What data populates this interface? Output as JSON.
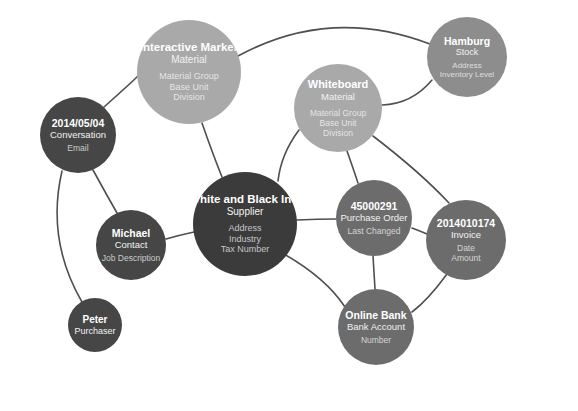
{
  "diagram": {
    "background_color": "#ffffff",
    "edge_color": "#4f4f4f"
  },
  "nodes": [
    {
      "id": "interactive-marker",
      "title": "Interactive Marker",
      "type": "Material",
      "attributes": [
        "Material Group",
        "Base Unit",
        "Division"
      ],
      "color": "#a9a9a9",
      "cx": 189,
      "cy": 72,
      "r": 52,
      "title_size": 11.5,
      "type_size": 10,
      "attr_size": 9
    },
    {
      "id": "whiteboard",
      "title": "Whiteboard",
      "type": "Material",
      "attributes": [
        "Material Group",
        "Base Unit",
        "Division"
      ],
      "color": "#a9a9a9",
      "cx": 338,
      "cy": 108,
      "r": 44,
      "title_size": 11,
      "type_size": 9.5,
      "attr_size": 8.5
    },
    {
      "id": "hamburg",
      "title": "Hamburg",
      "type": "Stock",
      "attributes": [
        "Address",
        "Inventory Level"
      ],
      "color": "#8d8d8d",
      "cx": 467,
      "cy": 57,
      "r": 40,
      "title_size": 10.5,
      "type_size": 9,
      "attr_size": 8
    },
    {
      "id": "conversation",
      "title": "2014/05/04",
      "type": "Conversation",
      "attributes": [
        "Email"
      ],
      "color": "#464646",
      "cx": 78,
      "cy": 135,
      "r": 38,
      "title_size": 10.5,
      "type_size": 9.5,
      "attr_size": 8.5
    },
    {
      "id": "white-and-black-inc",
      "title": "White and Black Inc.",
      "type": "Supplier",
      "attributes": [
        "Address",
        "Industry",
        "Tax Number"
      ],
      "color": "#3b3b3b",
      "cx": 245,
      "cy": 224,
      "r": 52,
      "title_size": 11.5,
      "type_size": 10,
      "attr_size": 9
    },
    {
      "id": "michael",
      "title": "Michael",
      "type": "Contact",
      "attributes": [
        "Job Description"
      ],
      "color": "#464646",
      "cx": 131,
      "cy": 245,
      "r": 35,
      "title_size": 10.5,
      "type_size": 9.5,
      "attr_size": 8.5
    },
    {
      "id": "peter",
      "title": "Peter",
      "type": "Purchaser",
      "attributes": [],
      "color": "#464646",
      "cx": 95,
      "cy": 325,
      "r": 27,
      "title_size": 10,
      "type_size": 9,
      "attr_size": 8
    },
    {
      "id": "purchase-order",
      "title": "45000291",
      "type": "Purchase Order",
      "attributes": [
        "Last Changed"
      ],
      "color": "#6c6c6c",
      "cx": 374,
      "cy": 218,
      "r": 38,
      "title_size": 10.5,
      "type_size": 9.5,
      "attr_size": 8.5
    },
    {
      "id": "invoice",
      "title": "2014010174",
      "type": "Invoice",
      "attributes": [
        "Date",
        "Amount"
      ],
      "color": "#6c6c6c",
      "cx": 466,
      "cy": 240,
      "r": 40,
      "title_size": 10.5,
      "type_size": 9.5,
      "attr_size": 8.5
    },
    {
      "id": "online-bank",
      "title": "Online Bank",
      "type": "Bank Account",
      "attributes": [
        "Number"
      ],
      "color": "#6c6c6c",
      "cx": 376,
      "cy": 327,
      "r": 38,
      "title_size": 10.5,
      "type_size": 9.5,
      "attr_size": 8.5
    }
  ],
  "edges": [
    {
      "id": "edge-conversation-interactive-marker",
      "from": "conversation",
      "to": "interactive-marker",
      "path": "M 104 107 Q 132 82 138 76"
    },
    {
      "id": "edge-interactive-marker-hamburg",
      "from": "interactive-marker",
      "to": "hamburg",
      "path": "M 238 56 Q 330 6 430 44"
    },
    {
      "id": "edge-interactive-marker-supplier",
      "from": "interactive-marker",
      "to": "white-and-black-inc",
      "path": "M 202 123 Q 212 152 222 177"
    },
    {
      "id": "edge-whiteboard-hamburg",
      "from": "whiteboard",
      "to": "hamburg",
      "path": "M 382 105 Q 412 104 432 80"
    },
    {
      "id": "edge-whiteboard-supplier",
      "from": "whiteboard",
      "to": "white-and-black-inc",
      "path": "M 299 130 Q 281 154 278 181"
    },
    {
      "id": "edge-whiteboard-purchase-order",
      "from": "whiteboard",
      "to": "purchase-order",
      "path": "M 347 151 Q 352 165 358 183"
    },
    {
      "id": "edge-whiteboard-invoice",
      "from": "whiteboard",
      "to": "invoice",
      "path": "M 373 136 Q 420 172 449 203"
    },
    {
      "id": "edge-supplier-purchase-order",
      "from": "white-and-black-inc",
      "to": "purchase-order",
      "path": "M 297 220 Q 318 219 336 219"
    },
    {
      "id": "edge-purchase-order-invoice",
      "from": "purchase-order",
      "to": "invoice",
      "path": "M 412 228 Q 420 231 427 234"
    },
    {
      "id": "edge-purchase-order-online-bank",
      "from": "purchase-order",
      "to": "online-bank",
      "path": "M 373 256 Q 374 272 375 289"
    },
    {
      "id": "edge-supplier-online-bank",
      "from": "white-and-black-inc",
      "to": "online-bank",
      "path": "M 284 254 Q 326 278 345 307"
    },
    {
      "id": "edge-invoice-online-bank",
      "from": "invoice",
      "to": "online-bank",
      "path": "M 447 274 Q 428 300 412 312"
    },
    {
      "id": "edge-conversation-michael",
      "from": "conversation",
      "to": "michael",
      "path": "M 93 170 Q 105 192 117 213"
    },
    {
      "id": "edge-conversation-peter",
      "from": "conversation",
      "to": "peter",
      "path": "M 62 171 Q 46 240 82 302"
    },
    {
      "id": "edge-michael-supplier",
      "from": "michael",
      "to": "white-and-black-inc",
      "path": "M 166 239 Q 180 235 194 232"
    }
  ]
}
